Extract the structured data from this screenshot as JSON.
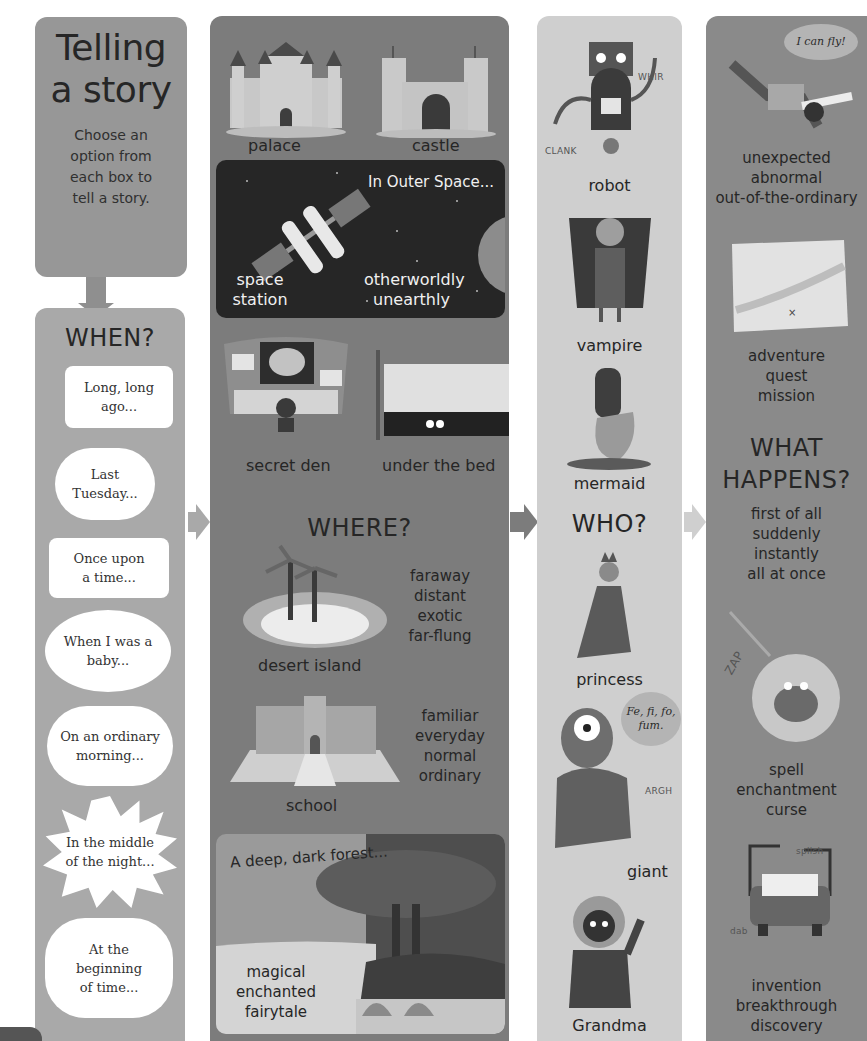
{
  "title_box": {
    "title_line1": "Telling",
    "title_line2": "a story",
    "subtitle_lines": [
      "Choose an",
      "option from",
      "each box to",
      "tell a story."
    ]
  },
  "when": {
    "heading": "WHEN?",
    "options": [
      {
        "text": "Long, long ago...",
        "shape": "speech-rect"
      },
      {
        "text": "Last Tuesday...",
        "shape": "thought-cloud"
      },
      {
        "text": "Once upon a time...",
        "shape": "speech-rect"
      },
      {
        "text": "When I was a baby...",
        "shape": "oval"
      },
      {
        "text": "On an ordinary morning...",
        "shape": "cloud"
      },
      {
        "text": "In the middle of the night...",
        "shape": "burst"
      },
      {
        "text": "At the beginning of time...",
        "shape": "thought-cloud"
      }
    ]
  },
  "where": {
    "heading": "WHERE?",
    "places": {
      "palace": "palace",
      "castle": "castle",
      "space_title": "In Outer Space...",
      "space_station": "space station",
      "space_words": "otherworldly unearthly",
      "secret_den": "secret den",
      "under_bed": "under the bed",
      "desert_island": "desert island",
      "island_words": [
        "faraway",
        "distant",
        "exotic",
        "far-flung"
      ],
      "school": "school",
      "school_words": [
        "familiar",
        "everyday",
        "normal",
        "ordinary"
      ],
      "forest_title": "A deep, dark forest...",
      "forest_words": [
        "magical",
        "enchanted",
        "fairytale"
      ]
    }
  },
  "who": {
    "heading": "WHO?",
    "characters": {
      "robot": "robot",
      "robot_sfx_1": "WHIR",
      "robot_sfx_2": "CLANK",
      "vampire": "vampire",
      "mermaid": "mermaid",
      "princess": "princess",
      "giant": "giant",
      "giant_speech": "Fe, fi, fo, fum.",
      "giant_sfx": "ARGH",
      "grandma": "Grandma"
    }
  },
  "what_happens": {
    "heading_line1": "WHAT",
    "heading_line2": "HAPPENS?",
    "fly_speech": "I can fly!",
    "unexpected_words": [
      "unexpected",
      "abnormal",
      "out-of-the-ordinary"
    ],
    "adventure_words": [
      "adventure",
      "quest",
      "mission"
    ],
    "time_words": [
      "first of all",
      "suddenly",
      "instantly",
      "all at once"
    ],
    "zap_sfx": "ZAP",
    "spell_words": [
      "spell",
      "enchantment",
      "curse"
    ],
    "car_sfx_1": "splish",
    "car_sfx_2": "dab",
    "invention_words": [
      "invention",
      "breakthrough",
      "discovery"
    ]
  },
  "colors": {
    "title_box": "#979797",
    "when_column": "#a9a9a9",
    "where_column": "#7c7c7c",
    "who_column": "#cfcfcf",
    "happens_column": "#8a8a8a",
    "space_panel": "#262626"
  }
}
